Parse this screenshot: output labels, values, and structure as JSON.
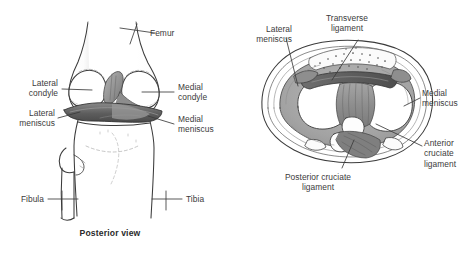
{
  "figure": {
    "background_color": "#ffffff",
    "ink_color": "#3b3b3b",
    "shade_color": "#a9a9a9",
    "dark_shade_color": "#6b6b6b"
  },
  "panels": [
    {
      "id": "posterior",
      "caption": "Posterior view",
      "labels": [
        {
          "id": "femur",
          "text": "Femur",
          "align": "left"
        },
        {
          "id": "lateral-condyle",
          "text": "Lateral\ncondyle",
          "align": "right"
        },
        {
          "id": "lateral-meniscus",
          "text": "Lateral\nmeniscus",
          "align": "right"
        },
        {
          "id": "medial-condyle",
          "text": "Medial\ncondyle",
          "align": "left"
        },
        {
          "id": "medial-meniscus",
          "text": "Medial\nmeniscus",
          "align": "left"
        },
        {
          "id": "fibula",
          "text": "Fibula",
          "align": "right"
        },
        {
          "id": "tibia",
          "text": "Tibia",
          "align": "left"
        }
      ]
    },
    {
      "id": "top",
      "caption": "Top view",
      "labels": [
        {
          "id": "lateral-meniscus",
          "text": "Lateral\nmeniscus",
          "align": "right"
        },
        {
          "id": "transverse-ligament",
          "text": "Transverse\nligament",
          "align": "center"
        },
        {
          "id": "medial-meniscus",
          "text": "Medial\nmeniscus",
          "align": "left"
        },
        {
          "id": "anterior-cruciate-ligament",
          "text": "Anterior\ncruciate\nligament",
          "align": "left"
        },
        {
          "id": "posterior-cruciate-ligament",
          "text": "Posterior cruciate\nligament",
          "align": "center"
        }
      ]
    }
  ]
}
